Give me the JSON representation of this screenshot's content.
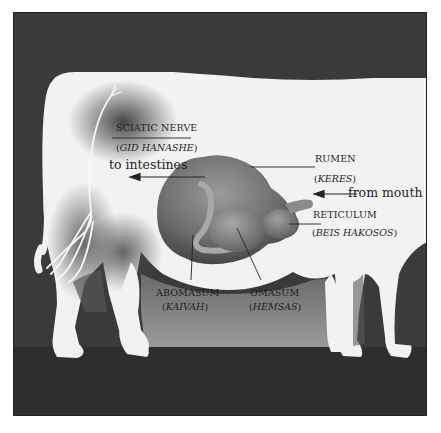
{
  "diagram": {
    "labels": {
      "sciatic_nerve": {
        "name": "SCIATIC NERVE",
        "hebrew": "GID HANASHE"
      },
      "rumen": {
        "name": "RUMEN",
        "hebrew": "KERES"
      },
      "reticulum": {
        "name": "RETICULUM",
        "hebrew": "BEIS HAKOSOS"
      },
      "abomasum": {
        "name": "ABOMASUM",
        "hebrew": "KAIVAH"
      },
      "omasum": {
        "name": "OMASUM",
        "hebrew": "HEMSAS"
      }
    },
    "arrows": {
      "to_intestines": "to intestines",
      "from_mouth": "from mouth"
    },
    "colors": {
      "background_dark": "#3a3a3a",
      "ground": "#2e2e2e",
      "cow_body": "#f2f2f2",
      "stomach": "#7a7a7a",
      "text": "#1e1e1e"
    }
  }
}
